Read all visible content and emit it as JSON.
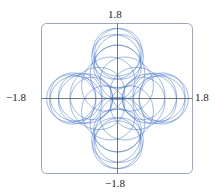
{
  "chart_data": {
    "type": "line",
    "title": "",
    "xlabel": "",
    "ylabel": "",
    "xlim": [
      -1.8,
      1.8
    ],
    "ylim": [
      -1.8,
      1.8
    ],
    "grid": false,
    "legend": null,
    "tick_labels": {
      "top": "1.8",
      "bottom": "−1.8",
      "left": "−1.8",
      "right": "1.8"
    },
    "series": [
      {
        "name": "parametric curve",
        "color": "#3a6fd8",
        "approx_extent": {
          "outer_radius": 1.7,
          "inner_hole_radius": 1.2
        },
        "rosette_centers": [
          [
            -0.52,
            0.55
          ],
          [
            0.52,
            0.55
          ],
          [
            -0.52,
            -0.55
          ],
          [
            0.52,
            -0.55
          ]
        ]
      }
    ],
    "frame": {
      "color": "#9aa6c8",
      "rounded": true
    },
    "axes_color": "#555555"
  }
}
